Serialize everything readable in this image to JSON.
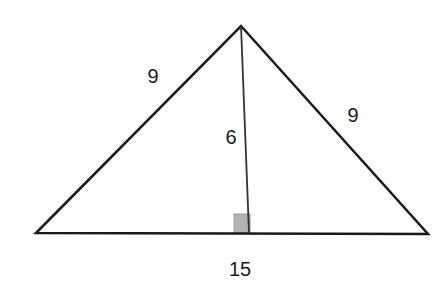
{
  "figure": {
    "type": "isosceles-triangle-with-altitude",
    "colors": {
      "stroke": "#1a1a1a",
      "right_angle_fill": "#b3b3b3",
      "background": "#ffffff"
    },
    "labels": {
      "left_side": "9",
      "right_side": "9",
      "altitude": "6",
      "base": "15"
    }
  }
}
